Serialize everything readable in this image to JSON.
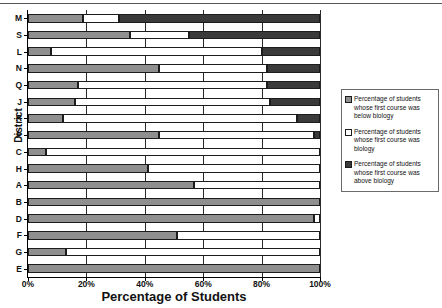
{
  "chart_data": {
    "type": "bar",
    "orientation": "horizontal",
    "stacked": true,
    "stack_mode": "percent",
    "title": "",
    "xlabel": "Percentage of Students",
    "ylabel": "District",
    "xlim": [
      0,
      100
    ],
    "xticks": [
      0,
      20,
      40,
      60,
      80,
      100
    ],
    "xticklabels": [
      "0%",
      "20%",
      "40%",
      "60%",
      "80%",
      "100%"
    ],
    "grid": "vertical",
    "legend_position": "right",
    "categories": [
      "M",
      "S",
      "L",
      "N",
      "Q",
      "J",
      "R",
      "P",
      "C",
      "H",
      "A",
      "B",
      "D",
      "F",
      "G",
      "E"
    ],
    "series": [
      {
        "name": "Percentage of students whose first course was below biology",
        "key": "below",
        "color": "#8f8f8f",
        "values": [
          19,
          35,
          8,
          45,
          17,
          16,
          12,
          45,
          6,
          41,
          57,
          100,
          98,
          51,
          13,
          100
        ]
      },
      {
        "name": "Percentage of students whose first course was biology",
        "key": "biology",
        "color": "#ffffff",
        "values": [
          12,
          20,
          72,
          37,
          65,
          67,
          80,
          53,
          94,
          59,
          43,
          0,
          2,
          49,
          87,
          0
        ]
      },
      {
        "name": "Percentage of students whose first course was above biology",
        "key": "above",
        "color": "#3a3a3a",
        "values": [
          69,
          45,
          20,
          18,
          18,
          17,
          8,
          2,
          0,
          0,
          0,
          0,
          0,
          0,
          0,
          0
        ]
      }
    ]
  },
  "legend": {
    "items": [
      {
        "label": "Percentage of students whose first course was below biology",
        "swatch": "below"
      },
      {
        "label": "Percentage of students whose first course was biology",
        "swatch": "bio"
      },
      {
        "label": "Percentage of students whose first course was above biology",
        "swatch": "above"
      }
    ]
  }
}
